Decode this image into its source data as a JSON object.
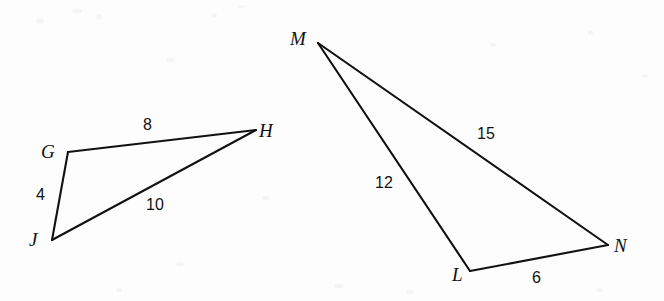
{
  "figure": {
    "background_color": "#fdfdfd",
    "stroke_color": "#111111",
    "text_color": "#111111",
    "stroke_width": 2.1,
    "width": 664,
    "height": 301
  },
  "triangles": [
    {
      "name": "triangle-GHJ",
      "vertices": [
        {
          "id": "G",
          "label": "G",
          "x": 68,
          "y": 152,
          "label_x": 41,
          "label_y": 142
        },
        {
          "id": "H",
          "label": "H",
          "x": 256,
          "y": 130,
          "label_x": 259,
          "label_y": 121
        },
        {
          "id": "J",
          "label": "J",
          "x": 52,
          "y": 240,
          "label_x": 29,
          "label_y": 230
        }
      ],
      "sides": [
        {
          "id": "GH",
          "from": "G",
          "to": "H",
          "length": "8",
          "label_x": 143,
          "label_y": 117
        },
        {
          "id": "GJ",
          "from": "G",
          "to": "J",
          "length": "4",
          "label_x": 36,
          "label_y": 187
        },
        {
          "id": "JH",
          "from": "J",
          "to": "H",
          "length": "10",
          "label_x": 146,
          "label_y": 197
        }
      ]
    },
    {
      "name": "triangle-MLN",
      "vertices": [
        {
          "id": "M",
          "label": "M",
          "x": 318,
          "y": 43,
          "label_x": 290,
          "label_y": 29
        },
        {
          "id": "L",
          "label": "L",
          "x": 470,
          "y": 271,
          "label_x": 452,
          "label_y": 265
        },
        {
          "id": "N",
          "label": "N",
          "x": 608,
          "y": 245,
          "label_x": 614,
          "label_y": 236
        }
      ],
      "sides": [
        {
          "id": "MN",
          "from": "M",
          "to": "N",
          "length": "15",
          "label_x": 477,
          "label_y": 126
        },
        {
          "id": "ML",
          "from": "M",
          "to": "L",
          "length": "12",
          "label_x": 375,
          "label_y": 175
        },
        {
          "id": "LN",
          "from": "L",
          "to": "N",
          "length": "6",
          "label_x": 532,
          "label_y": 270
        }
      ]
    }
  ],
  "speckles": [
    {
      "x": 36,
      "y": 18,
      "w": 8,
      "h": 5
    },
    {
      "x": 72,
      "y": 9,
      "w": 10,
      "h": 4
    },
    {
      "x": 96,
      "y": 14,
      "w": 6,
      "h": 6
    },
    {
      "x": 212,
      "y": 13,
      "w": 5,
      "h": 4
    },
    {
      "x": 238,
      "y": 5,
      "w": 7,
      "h": 3
    },
    {
      "x": 166,
      "y": 58,
      "w": 9,
      "h": 4
    },
    {
      "x": 490,
      "y": 43,
      "w": 6,
      "h": 4
    },
    {
      "x": 588,
      "y": 30,
      "w": 5,
      "h": 5
    },
    {
      "x": 642,
      "y": 74,
      "w": 6,
      "h": 4
    },
    {
      "x": 262,
      "y": 196,
      "w": 7,
      "h": 4
    },
    {
      "x": 176,
      "y": 262,
      "w": 9,
      "h": 4
    },
    {
      "x": 334,
      "y": 284,
      "w": 10,
      "h": 4
    },
    {
      "x": 406,
      "y": 290,
      "w": 8,
      "h": 4
    },
    {
      "x": 596,
      "y": 288,
      "w": 7,
      "h": 4
    },
    {
      "x": 116,
      "y": 288,
      "w": 6,
      "h": 4
    }
  ]
}
